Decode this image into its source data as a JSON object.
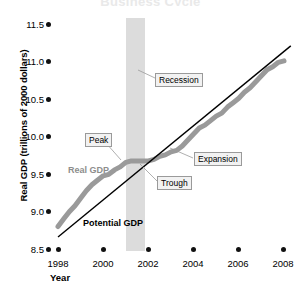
{
  "chart_data": {
    "type": "line",
    "title": "Business Cycle",
    "xlabel": "Year",
    "ylabel": "Real GDP (trillions of 2000 dollars)",
    "xlim": [
      1997.5,
      2008.5
    ],
    "ylim": [
      8.5,
      11.5
    ],
    "xticks": [
      "1998",
      "2000",
      "2002",
      "2004",
      "2006",
      "2008"
    ],
    "xtick_values": [
      1998,
      2000,
      2002,
      2004,
      2006,
      2008
    ],
    "yticks": [
      "8.5",
      "9.0",
      "9.5",
      "10.0",
      "10.5",
      "11.0",
      "11.5"
    ],
    "ytick_values": [
      8.5,
      9.0,
      9.5,
      10.0,
      10.5,
      11.0,
      11.5
    ],
    "grid": false,
    "legend": "inline-labels",
    "colors": {
      "real_gdp": "#9a9a9a",
      "potential_gdp": "#000000",
      "recession_band": "#dcdcdc",
      "callout_fill": "#f2f2f2",
      "callout_border": "#9a9a9a"
    },
    "series": [
      {
        "name": "Real GDP",
        "color": "#9a9a9a",
        "x": [
          1998.0,
          1998.25,
          1998.5,
          1998.75,
          1999.0,
          1999.25,
          1999.5,
          1999.75,
          2000.0,
          2000.25,
          2000.5,
          2000.75,
          2001.0,
          2001.25,
          2001.5,
          2001.75,
          2002.0,
          2002.25,
          2002.5,
          2002.75,
          2003.0,
          2003.25,
          2003.5,
          2003.75,
          2004.0,
          2004.25,
          2004.5,
          2004.75,
          2005.0,
          2005.25,
          2005.5,
          2005.75,
          2006.0,
          2006.25,
          2006.5,
          2006.75,
          2007.0,
          2007.25,
          2007.5,
          2007.75,
          2008.0
        ],
        "y": [
          8.8,
          8.9,
          9.0,
          9.08,
          9.18,
          9.28,
          9.36,
          9.42,
          9.48,
          9.5,
          9.56,
          9.6,
          9.66,
          9.68,
          9.68,
          9.68,
          9.68,
          9.7,
          9.74,
          9.76,
          9.8,
          9.82,
          9.88,
          9.96,
          10.04,
          10.12,
          10.16,
          10.22,
          10.28,
          10.32,
          10.4,
          10.46,
          10.52,
          10.6,
          10.66,
          10.74,
          10.82,
          10.9,
          10.94,
          11.0,
          11.02
        ]
      },
      {
        "name": "Potential GDP",
        "color": "#000000",
        "x": [
          1998.0,
          2008.3
        ],
        "y": [
          8.66,
          11.22
        ]
      }
    ],
    "annotations": [
      {
        "label": "Recession",
        "type": "callout",
        "target_x": 2001.4,
        "target_y": 10.6
      },
      {
        "label": "Peak",
        "type": "callout",
        "target_x": 2000.9,
        "target_y": 9.68
      },
      {
        "label": "Trough",
        "type": "callout",
        "target_x": 2001.9,
        "target_y": 9.68
      },
      {
        "label": "Expansion",
        "type": "callout",
        "target_x": 2002.9,
        "target_y": 9.82
      },
      {
        "label": "Real GDP",
        "type": "series-label"
      },
      {
        "label": "Potential GDP",
        "type": "series-label"
      }
    ],
    "shaded_regions": [
      {
        "name": "recession",
        "x_start": 2001.0,
        "x_end": 2001.85,
        "color": "#dcdcdc"
      }
    ]
  }
}
